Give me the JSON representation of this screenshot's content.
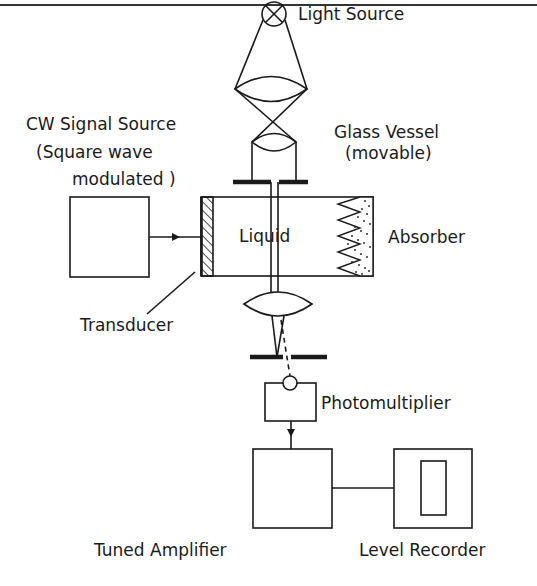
{
  "figure": {
    "type": "experimental apparatus schematic",
    "labels": {
      "light_source": "Light Source",
      "cw_signal_source_line1": "CW Signal Source",
      "cw_signal_source_line2": "(Square wave",
      "cw_signal_source_line3": "modulated )",
      "glass_vessel_line1": "Glass Vessel",
      "glass_vessel_line2": "(movable)",
      "liquid": "Liquid",
      "absorber": "Absorber",
      "transducer": "Transducer",
      "photomultiplier": "Photomultiplier",
      "tuned_amplifier": "Tuned Amplifier",
      "level_recorder": "Level Recorder"
    },
    "components": [
      "light-source-lamp",
      "condenser-lens",
      "collimating-lens",
      "slit-aperture-upper",
      "cw-signal-source",
      "transducer",
      "glass-vessel",
      "absorber",
      "focusing-lens",
      "slit-aperture-lower",
      "photomultiplier",
      "tuned-amplifier",
      "level-recorder"
    ],
    "colors": {
      "ink": "#1a1a1a",
      "background": "#ffffff"
    }
  }
}
